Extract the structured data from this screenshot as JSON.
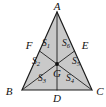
{
  "figure": {
    "kind": "geometry-diagram",
    "shape": "triangle",
    "colors": {
      "region_fill": "#c9c9c9",
      "stroke": "#1c1c1c",
      "background": "#ffffff",
      "label_text": "#111111"
    }
  },
  "vertices": [
    {
      "id": "A",
      "label": "A",
      "x": 57,
      "y": 12,
      "label_x": 57,
      "label_y": 7
    },
    {
      "id": "B",
      "label": "B",
      "x": 22,
      "y": 90,
      "label_x": 9,
      "label_y": 92
    },
    {
      "id": "C",
      "label": "C",
      "x": 92,
      "y": 90,
      "label_x": 100,
      "label_y": 92
    }
  ],
  "midpoints": [
    {
      "id": "F",
      "label": "F",
      "x": 39.5,
      "y": 51,
      "label_x": 29,
      "label_y": 46,
      "on_side": "AB"
    },
    {
      "id": "E",
      "label": "E",
      "x": 74.5,
      "y": 51,
      "label_x": 85,
      "label_y": 46,
      "on_side": "AC"
    },
    {
      "id": "D",
      "label": "D",
      "x": 57,
      "y": 90,
      "label_x": 57,
      "label_y": 99,
      "on_side": "BC"
    }
  ],
  "centroid": {
    "id": "G",
    "label": "G",
    "x": 57,
    "y": 64,
    "label_x": 57,
    "label_y": 74
  },
  "medians": [
    {
      "id": "median-A-D",
      "from": "A",
      "to": "D"
    },
    {
      "id": "median-B-E",
      "from": "B",
      "to": "E"
    },
    {
      "id": "median-C-F",
      "from": "C",
      "to": "F"
    }
  ],
  "regions": [
    {
      "id": "S1",
      "label": "S",
      "subscript": "1",
      "points": "57,12 39.5,51 57,64",
      "label_x": 46,
      "label_y": 44
    },
    {
      "id": "S2",
      "label": "S",
      "subscript": "2",
      "points": "39.5,51 22,90 57,64",
      "label_x": 36,
      "label_y": 62
    },
    {
      "id": "S3",
      "label": "S",
      "subscript": "3",
      "points": "22,90 57,90 57,64",
      "label_x": 42,
      "label_y": 79
    },
    {
      "id": "S4",
      "label": "S",
      "subscript": "4",
      "points": "57,90 92,90 57,64",
      "label_x": 70,
      "label_y": 79
    },
    {
      "id": "S5",
      "label": "S",
      "subscript": "5",
      "points": "92,90 74.5,51 57,64",
      "label_x": 76,
      "label_y": 62
    },
    {
      "id": "S6",
      "label": "S",
      "subscript": "6",
      "points": "74.5,51 57,12 57,64",
      "label_x": 66,
      "label_y": 44
    }
  ]
}
